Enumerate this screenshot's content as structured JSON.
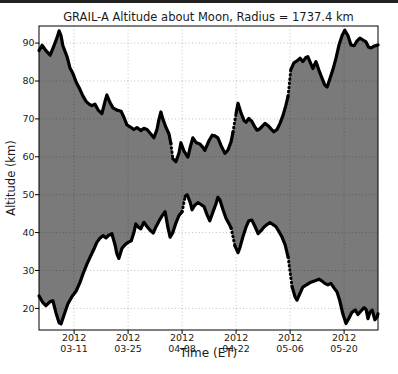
{
  "page": {
    "background": "#ffffff",
    "top_border_color": "#222222"
  },
  "chart_data": {
    "type": "area",
    "title": "GRAIL-A Altitude about Moon, Radius = 1737.4 km",
    "xlabel": "Time (ET)",
    "ylabel": "Altitude (km)",
    "grid": true,
    "legend": "none",
    "fill_color": "#7a7a7a",
    "line_color": "#000000",
    "axis_color": "#000000",
    "grid_color": "rgba(0,0,0,0.25)",
    "text_color": "#1a1a1a",
    "ylim": [
      14.3,
      94.5
    ],
    "xlim_days": [
      0,
      87.9
    ],
    "y_ticks": [
      20,
      30,
      40,
      50,
      60,
      70,
      80,
      90
    ],
    "x_ticks": [
      {
        "day": 9.1,
        "line1": "2012",
        "line2": "03-11"
      },
      {
        "day": 23.1,
        "line1": "2012",
        "line2": "03-25"
      },
      {
        "day": 37.1,
        "line1": "2012",
        "line2": "04-08"
      },
      {
        "day": 51.1,
        "line1": "2012",
        "line2": "04-22"
      },
      {
        "day": 65.1,
        "line1": "2012",
        "line2": "05-06"
      },
      {
        "day": 79.1,
        "line1": "2012",
        "line2": "05-20"
      }
    ],
    "series": [
      {
        "name": "upper-envelope-max-altitude",
        "dotted_after": [
          43,
          64,
          84
        ],
        "points": [
          [
            0.0,
            88.0
          ],
          [
            0.8,
            89.4
          ],
          [
            1.8,
            88.0
          ],
          [
            2.9,
            86.8
          ],
          [
            3.9,
            89.3
          ],
          [
            4.7,
            91.5
          ],
          [
            5.2,
            93.2
          ],
          [
            5.7,
            92.0
          ],
          [
            6.2,
            89.3
          ],
          [
            7.3,
            86.3
          ],
          [
            8.0,
            83.5
          ],
          [
            8.8,
            82.0
          ],
          [
            9.6,
            79.8
          ],
          [
            10.6,
            77.8
          ],
          [
            11.4,
            76.0
          ],
          [
            12.2,
            74.6
          ],
          [
            13.0,
            73.9
          ],
          [
            13.7,
            73.5
          ],
          [
            14.5,
            73.9
          ],
          [
            15.3,
            72.4
          ],
          [
            16.3,
            71.4
          ],
          [
            17.1,
            74.5
          ],
          [
            17.6,
            76.3
          ],
          [
            18.4,
            74.3
          ],
          [
            19.2,
            72.9
          ],
          [
            20.2,
            72.3
          ],
          [
            21.3,
            72.0
          ],
          [
            22.0,
            70.5
          ],
          [
            22.8,
            68.4
          ],
          [
            23.6,
            67.9
          ],
          [
            24.6,
            67.2
          ],
          [
            25.4,
            67.7
          ],
          [
            26.4,
            66.9
          ],
          [
            27.2,
            67.5
          ],
          [
            28.0,
            67.2
          ],
          [
            29.0,
            66.0
          ],
          [
            29.8,
            65.0
          ],
          [
            30.6,
            67.2
          ],
          [
            31.1,
            69.8
          ],
          [
            31.6,
            71.8
          ],
          [
            32.1,
            70.0
          ],
          [
            32.9,
            67.8
          ],
          [
            33.7,
            66.0
          ],
          [
            34.2,
            63.5
          ],
          [
            34.7,
            59.5
          ],
          [
            35.5,
            58.7
          ],
          [
            36.3,
            61.0
          ],
          [
            36.8,
            63.7
          ],
          [
            37.6,
            61.5
          ],
          [
            38.6,
            59.9
          ],
          [
            39.2,
            62.5
          ],
          [
            39.9,
            65.0
          ],
          [
            40.7,
            63.8
          ],
          [
            41.7,
            63.4
          ],
          [
            42.5,
            62.5
          ],
          [
            43.0,
            61.7
          ],
          [
            44.1,
            64.3
          ],
          [
            44.9,
            65.7
          ],
          [
            45.6,
            65.5
          ],
          [
            46.4,
            65.0
          ],
          [
            47.2,
            63.0
          ],
          [
            48.2,
            60.9
          ],
          [
            49.0,
            61.8
          ],
          [
            49.8,
            64.0
          ],
          [
            50.3,
            66.5
          ],
          [
            51.1,
            71.5
          ],
          [
            51.6,
            74.1
          ],
          [
            52.4,
            71.5
          ],
          [
            53.2,
            69.5
          ],
          [
            53.7,
            69.1
          ],
          [
            54.4,
            70.1
          ],
          [
            55.2,
            69.3
          ],
          [
            56.0,
            67.8
          ],
          [
            56.5,
            67.0
          ],
          [
            57.3,
            67.4
          ],
          [
            58.1,
            68.3
          ],
          [
            58.6,
            68.8
          ],
          [
            59.4,
            68.2
          ],
          [
            60.2,
            67.3
          ],
          [
            60.9,
            66.6
          ],
          [
            61.7,
            67.2
          ],
          [
            62.5,
            68.8
          ],
          [
            63.3,
            71.0
          ],
          [
            64.0,
            73.5
          ],
          [
            64.6,
            76.0
          ],
          [
            65.3,
            83.0
          ],
          [
            66.1,
            84.8
          ],
          [
            66.9,
            85.3
          ],
          [
            67.7,
            86.0
          ],
          [
            68.4,
            85.1
          ],
          [
            69.2,
            86.2
          ],
          [
            69.7,
            86.4
          ],
          [
            70.5,
            84.5
          ],
          [
            71.0,
            83.3
          ],
          [
            71.8,
            85.1
          ],
          [
            72.6,
            82.8
          ],
          [
            73.4,
            80.7
          ],
          [
            74.1,
            78.9
          ],
          [
            74.7,
            78.4
          ],
          [
            75.4,
            80.5
          ],
          [
            76.2,
            83.0
          ],
          [
            77.0,
            86.0
          ],
          [
            77.8,
            89.5
          ],
          [
            78.6,
            92.0
          ],
          [
            79.3,
            93.4
          ],
          [
            80.1,
            92.0
          ],
          [
            80.9,
            89.5
          ],
          [
            81.7,
            89.3
          ],
          [
            82.4,
            90.5
          ],
          [
            83.2,
            91.3
          ],
          [
            84.0,
            90.8
          ],
          [
            84.8,
            90.3
          ],
          [
            85.5,
            88.9
          ],
          [
            86.1,
            88.7
          ],
          [
            86.9,
            89.2
          ],
          [
            87.9,
            89.5
          ]
        ]
      },
      {
        "name": "lower-envelope-min-altitude",
        "dotted_after": [
          47,
          65,
          84
        ],
        "points": [
          [
            0.0,
            23.3
          ],
          [
            1.0,
            21.5
          ],
          [
            1.8,
            20.7
          ],
          [
            2.9,
            21.8
          ],
          [
            3.6,
            22.0
          ],
          [
            4.4,
            18.8
          ],
          [
            5.2,
            16.2
          ],
          [
            5.7,
            15.9
          ],
          [
            6.5,
            18.3
          ],
          [
            7.5,
            21.2
          ],
          [
            8.6,
            23.2
          ],
          [
            9.6,
            24.5
          ],
          [
            10.6,
            26.8
          ],
          [
            11.4,
            29.1
          ],
          [
            12.4,
            31.6
          ],
          [
            13.2,
            33.4
          ],
          [
            14.3,
            35.8
          ],
          [
            15.0,
            37.4
          ],
          [
            15.8,
            38.5
          ],
          [
            16.6,
            39.2
          ],
          [
            17.4,
            38.6
          ],
          [
            18.1,
            39.3
          ],
          [
            18.9,
            39.7
          ],
          [
            19.7,
            36.8
          ],
          [
            20.2,
            34.4
          ],
          [
            20.7,
            33.2
          ],
          [
            21.5,
            35.8
          ],
          [
            22.3,
            36.8
          ],
          [
            23.1,
            37.4
          ],
          [
            23.9,
            37.8
          ],
          [
            24.6,
            40.0
          ],
          [
            25.1,
            42.3
          ],
          [
            25.9,
            41.3
          ],
          [
            26.4,
            41.0
          ],
          [
            27.2,
            42.7
          ],
          [
            28.0,
            41.6
          ],
          [
            28.8,
            40.6
          ],
          [
            29.6,
            39.9
          ],
          [
            30.3,
            41.5
          ],
          [
            31.1,
            43.0
          ],
          [
            31.9,
            44.4
          ],
          [
            32.7,
            45.5
          ],
          [
            33.4,
            41.5
          ],
          [
            34.0,
            38.8
          ],
          [
            34.7,
            40.0
          ],
          [
            35.5,
            42.5
          ],
          [
            36.3,
            44.5
          ],
          [
            37.1,
            45.5
          ],
          [
            37.9,
            49.6
          ],
          [
            38.4,
            50.0
          ],
          [
            39.2,
            48.0
          ],
          [
            39.7,
            46.0
          ],
          [
            40.4,
            47.2
          ],
          [
            41.2,
            47.9
          ],
          [
            42.0,
            47.4
          ],
          [
            42.8,
            46.8
          ],
          [
            43.6,
            44.6
          ],
          [
            44.3,
            43.1
          ],
          [
            45.1,
            45.4
          ],
          [
            45.9,
            47.6
          ],
          [
            46.4,
            49.3
          ],
          [
            46.9,
            48.6
          ],
          [
            47.7,
            46.0
          ],
          [
            48.5,
            43.8
          ],
          [
            49.3,
            42.3
          ],
          [
            49.8,
            41.2
          ],
          [
            50.8,
            36.5
          ],
          [
            51.6,
            34.7
          ],
          [
            52.1,
            36.0
          ],
          [
            52.9,
            39.0
          ],
          [
            53.7,
            41.5
          ],
          [
            54.4,
            43.1
          ],
          [
            55.2,
            43.3
          ],
          [
            56.0,
            41.6
          ],
          [
            56.8,
            39.7
          ],
          [
            57.6,
            40.5
          ],
          [
            58.3,
            41.4
          ],
          [
            59.1,
            42.1
          ],
          [
            59.9,
            42.6
          ],
          [
            60.7,
            42.1
          ],
          [
            61.4,
            41.6
          ],
          [
            62.2,
            40.3
          ],
          [
            63.0,
            38.8
          ],
          [
            63.8,
            36.8
          ],
          [
            64.6,
            33.5
          ],
          [
            65.6,
            25.8
          ],
          [
            66.4,
            23.0
          ],
          [
            66.9,
            22.2
          ],
          [
            67.7,
            24.0
          ],
          [
            68.4,
            25.6
          ],
          [
            69.5,
            26.3
          ],
          [
            70.5,
            26.9
          ],
          [
            71.6,
            27.3
          ],
          [
            72.6,
            27.7
          ],
          [
            73.4,
            27.2
          ],
          [
            74.1,
            26.6
          ],
          [
            74.9,
            26.2
          ],
          [
            75.7,
            26.6
          ],
          [
            76.5,
            25.4
          ],
          [
            77.3,
            24.3
          ],
          [
            78.0,
            22.0
          ],
          [
            78.8,
            18.5
          ],
          [
            79.6,
            16.0
          ],
          [
            80.4,
            17.5
          ],
          [
            81.1,
            18.9
          ],
          [
            82.0,
            19.6
          ],
          [
            82.7,
            18.4
          ],
          [
            83.5,
            19.3
          ],
          [
            84.3,
            20.2
          ],
          [
            84.8,
            19.8
          ],
          [
            85.3,
            17.3
          ],
          [
            85.8,
            19.0
          ],
          [
            86.4,
            19.5
          ],
          [
            87.1,
            17.0
          ],
          [
            87.7,
            17.8
          ],
          [
            87.9,
            18.6
          ]
        ]
      }
    ]
  }
}
